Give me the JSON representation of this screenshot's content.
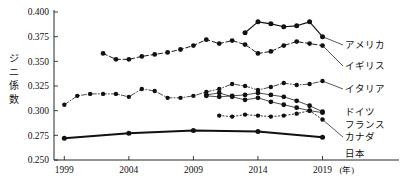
{
  "chart_data": {
    "type": "line",
    "title": "",
    "xlabel": "年",
    "ylabel": "ジニ係数",
    "xlim": [
      1998.2,
      2020.2
    ],
    "ylim": [
      0.25,
      0.4
    ],
    "ytick_labels": [
      "0.250",
      "0.275",
      "0.300",
      "0.325",
      "0.350",
      "0.375",
      "0.400"
    ],
    "ytick_values": [
      0.25,
      0.275,
      0.3,
      0.325,
      0.35,
      0.375,
      0.4
    ],
    "xtick_labels": [
      "1999",
      "2004",
      "2009",
      "2014",
      "2019"
    ],
    "xtick_values": [
      1999,
      2004,
      2009,
      2014,
      2019
    ],
    "x_unit_label": "(年)",
    "grid": false,
    "legend_position": "right-inline",
    "marker": "filled-circle",
    "series": [
      {
        "name": "アメリカ",
        "label": "アメリカ",
        "color": "#111111",
        "style": "solid",
        "x": [
          2013,
          2014,
          2015,
          2016,
          2017,
          2018,
          2019
        ],
        "values": [
          0.379,
          0.39,
          0.388,
          0.385,
          0.386,
          0.39,
          0.375
        ]
      },
      {
        "name": "イギリス",
        "label": "イギリス",
        "color": "#111111",
        "style": "dashed",
        "x": [
          2002,
          2003,
          2004,
          2005,
          2006,
          2007,
          2008,
          2009,
          2010,
          2011,
          2012,
          2013,
          2014,
          2015,
          2016,
          2017,
          2018,
          2019
        ],
        "values": [
          0.358,
          0.352,
          0.352,
          0.355,
          0.357,
          0.359,
          0.362,
          0.366,
          0.372,
          0.368,
          0.371,
          0.367,
          0.358,
          0.36,
          0.366,
          0.37,
          0.368,
          0.366
        ]
      },
      {
        "name": "イタリア",
        "label": "イタリア",
        "color": "#111111",
        "style": "dashdot",
        "x": [
          1999,
          2000,
          2001,
          2002,
          2003,
          2004,
          2005,
          2006,
          2007,
          2008,
          2009,
          2010,
          2011,
          2012,
          2013,
          2014,
          2015,
          2016,
          2017,
          2018,
          2019
        ],
        "values": [
          0.306,
          0.315,
          0.317,
          0.317,
          0.317,
          0.314,
          0.322,
          0.32,
          0.313,
          0.313,
          0.315,
          0.319,
          0.322,
          0.327,
          0.325,
          0.321,
          0.324,
          0.328,
          0.326,
          0.327,
          0.33
        ]
      },
      {
        "name": "ドイツ",
        "label": "ドイツ",
        "color": "#111111",
        "style": "solid-thin",
        "x": [
          2010,
          2011,
          2012,
          2013,
          2014,
          2015,
          2016,
          2017,
          2018,
          2019
        ],
        "values": [
          0.315,
          0.314,
          0.315,
          0.316,
          0.318,
          0.316,
          0.314,
          0.31,
          0.305,
          0.299
        ]
      },
      {
        "name": "フランス",
        "label": "フランス",
        "color": "#111111",
        "style": "solid-thin",
        "x": [
          2010,
          2011,
          2012,
          2013,
          2014,
          2015,
          2016,
          2017,
          2018,
          2019
        ],
        "values": [
          0.316,
          0.318,
          0.314,
          0.311,
          0.313,
          0.309,
          0.306,
          0.303,
          0.3,
          0.298
        ]
      },
      {
        "name": "カナダ",
        "label": "カナダ",
        "color": "#111111",
        "style": "dotted",
        "x": [
          2011,
          2012,
          2013,
          2014,
          2015,
          2016,
          2017,
          2018,
          2019
        ],
        "values": [
          0.295,
          0.294,
          0.296,
          0.295,
          0.294,
          0.295,
          0.297,
          0.3,
          0.291
        ]
      },
      {
        "name": "日本",
        "label": "日本",
        "color": "#111111",
        "style": "thick",
        "x": [
          1999,
          2004,
          2009,
          2014,
          2019
        ],
        "values": [
          0.272,
          0.277,
          0.28,
          0.279,
          0.273
        ]
      }
    ]
  },
  "labels": {
    "america": "アメリカ",
    "uk": "イギリス",
    "italy": "イタリア",
    "germany": "ドイツ",
    "france": "フランス",
    "canada": "カナダ",
    "japan": "日本",
    "y_axis_title": "ジニ係数",
    "x_unit": "(年)"
  }
}
